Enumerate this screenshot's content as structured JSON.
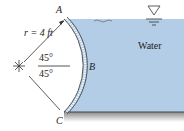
{
  "diagram": {
    "labels": {
      "point_a": "A",
      "point_b": "B",
      "point_c": "C",
      "radius": "r = 4 ft",
      "angle_top": "45°",
      "angle_bottom": "45°",
      "fluid": "Water"
    },
    "colors": {
      "water": "#b3cde6",
      "gate": "#555555",
      "ground": "#9a9a9a",
      "text": "#222222"
    },
    "icons": [
      "free-surface-icon",
      "hinge-center-icon"
    ]
  }
}
